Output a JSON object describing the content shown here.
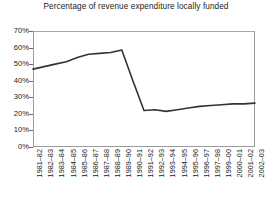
{
  "chart_data": {
    "type": "line",
    "title": "Percentage of revenue expenditure locally funded",
    "xlabel": "",
    "ylabel": "",
    "ylim": [
      0,
      70
    ],
    "ytick_step": 10,
    "ytick_labels": [
      "70%",
      "60%",
      "50%",
      "40%",
      "30%",
      "20%",
      "10%",
      "0%"
    ],
    "ytick_values": [
      70,
      60,
      50,
      40,
      30,
      20,
      10,
      0
    ],
    "grid": false,
    "legend": "none",
    "line_color": "#333333",
    "frame_color": "#9b9b9b",
    "categories": [
      "1981–82",
      "1982–83",
      "1983–84",
      "1984–85",
      "1985–86",
      "1986–87",
      "1987–88",
      "1988–89",
      "1989–90",
      "1990–91",
      "1991–92",
      "1992–93",
      "1993–94",
      "1994–95",
      "1995–96",
      "1996–97",
      "1997–98",
      "1999–00",
      "2000–01",
      "2001–02",
      "2002–03"
    ],
    "values": [
      47,
      48.5,
      50,
      51.5,
      54,
      56,
      56.5,
      57,
      58.5,
      40,
      22,
      22.5,
      21.5,
      22.5,
      23.5,
      24.5,
      25,
      25.5,
      26,
      26,
      26.5
    ]
  }
}
